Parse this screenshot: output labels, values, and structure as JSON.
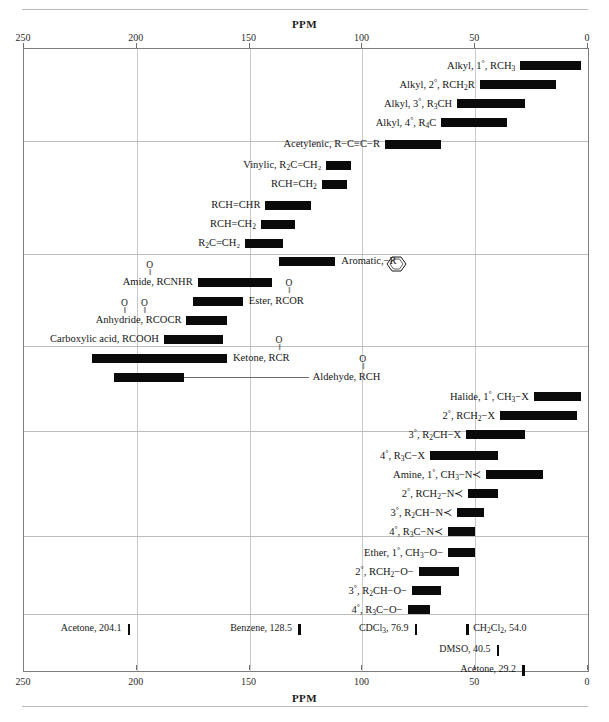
{
  "axis": {
    "title": "PPM",
    "ticks": [
      250,
      200,
      150,
      100,
      50,
      0
    ],
    "min_ppm": 0,
    "max_ppm": 250
  },
  "chart_data": {
    "type": "bar",
    "orientation": "horizontal-range",
    "title": "PPM",
    "xlabel": "PPM",
    "ylabel": "",
    "xlim": [
      250,
      0
    ],
    "x_reversed": true,
    "grid": true,
    "legend": "none",
    "categories": [
      "Alkyl, 1°, RCH3",
      "Alkyl, 2°, RCH2R",
      "Alkyl, 3°, R3CH",
      "Alkyl, 4°, R4C",
      "Acetylenic, R-C≡C-R",
      "Vinylic, R2C=CH2",
      "RCH=CH2",
      "RCH=CHR",
      "RCH=CH2",
      "R2C=CH2",
      "Aromatic",
      "Amide, RCONHR",
      "Ester, RCOOR",
      "Anhydride, RCOOCR",
      "Carboxylic acid, RCOOH",
      "Ketone, RCOR",
      "Aldehyde, RCHO",
      "Halide, 1°, CH3-X",
      "Halide, 2°, RCH2-X",
      "Halide, 3°, R2CH-X",
      "Halide, 4°, R3C-X",
      "Amine, 1°, CH3-N",
      "Amine, 2°, RCH2-N",
      "Amine, 3°, R2CH-N",
      "Amine, 4°, R3C-N",
      "Ether, 1°, CH3-O",
      "Ether, 2°, RCH2-O",
      "Ether, 3°, R2CH-O",
      "Ether, 4°, R3C-O"
    ],
    "ranges": [
      [
        30,
        3
      ],
      [
        48,
        14
      ],
      [
        58,
        28
      ],
      [
        65,
        36
      ],
      [
        90,
        65
      ],
      [
        116,
        105
      ],
      [
        118,
        107
      ],
      [
        143,
        123
      ],
      [
        145,
        130
      ],
      [
        152,
        135
      ],
      [
        137,
        112
      ],
      [
        173,
        140
      ],
      [
        175,
        153
      ],
      [
        178,
        160
      ],
      [
        188,
        162
      ],
      [
        220,
        160
      ],
      [
        210,
        179
      ],
      [
        24,
        3
      ],
      [
        39,
        5
      ],
      [
        54,
        28
      ],
      [
        70,
        40
      ],
      [
        45,
        20
      ],
      [
        53,
        40
      ],
      [
        58,
        46
      ],
      [
        62,
        50
      ],
      [
        62,
        50
      ],
      [
        75,
        57
      ],
      [
        78,
        65
      ],
      [
        80,
        70
      ]
    ],
    "reference_solvents": [
      {
        "label": "Acetone, 204.1",
        "ppm": 204.1
      },
      {
        "label": "Benzene, 128.5",
        "ppm": 128.5
      },
      {
        "label": "CDCl3, 76.9",
        "ppm": 76.9
      },
      {
        "label": "CH2Cl2, 54.0",
        "ppm": 54.0
      },
      {
        "label": "DMSO, 40.5",
        "ppm": 40.5
      },
      {
        "label": "Acetone, 29.2",
        "ppm": 29.2
      }
    ]
  },
  "rows": [
    {
      "label_pre": "Alkyl, 1",
      "label_deg": "°",
      "label_post": ", RCH",
      "sub": "3",
      "label_tail": "",
      "side": "left",
      "start": 30,
      "end": 3,
      "y": 60
    },
    {
      "label_pre": "Alkyl, 2",
      "label_deg": "°",
      "label_post": ", RCH",
      "sub": "2",
      "label_tail": "R",
      "side": "left",
      "start": 48,
      "end": 14,
      "y": 79
    },
    {
      "label_pre": "Alkyl, 3",
      "label_deg": "°",
      "label_post": ", R",
      "sub": "3",
      "label_tail": "CH",
      "side": "left",
      "start": 58,
      "end": 28,
      "y": 98
    },
    {
      "label_pre": "Alkyl, 4",
      "label_deg": "°",
      "label_post": ", R",
      "sub": "4",
      "label_tail": "C",
      "side": "left",
      "start": 65,
      "end": 36,
      "y": 117
    },
    {
      "label_pre": "Acetylenic, R−C≡C−R",
      "label_deg": "",
      "label_post": "",
      "sub": "",
      "label_tail": "",
      "side": "left",
      "start": 90,
      "end": 65,
      "y": 139
    },
    {
      "label_pre": "Vinylic, R",
      "label_deg": "",
      "label_post": "",
      "sub": "2",
      "label_tail": "C=CH₂",
      "side": "left",
      "start": 116,
      "end": 105,
      "y": 160
    },
    {
      "label_pre": "RCH=CH",
      "label_deg": "",
      "label_post": "",
      "sub": "2",
      "label_tail": "",
      "side": "left",
      "start": 118,
      "end": 107,
      "y": 179
    },
    {
      "label_pre": "RCH=CHR",
      "label_deg": "",
      "label_post": "",
      "sub": "",
      "label_tail": "",
      "side": "left",
      "start": 143,
      "end": 123,
      "y": 200
    },
    {
      "label_pre": "RCH=CH",
      "label_deg": "",
      "label_post": "",
      "sub": "2",
      "label_tail": "",
      "side": "left",
      "start": 145,
      "end": 130,
      "y": 219
    },
    {
      "label_pre": "R",
      "label_deg": "",
      "label_post": "",
      "sub": "2",
      "label_tail": "C=CH₂",
      "side": "left",
      "start": 152,
      "end": 135,
      "y": 238
    },
    {
      "label_pre": "Amide, RCNHR",
      "label_deg": "",
      "label_post": "",
      "sub": "",
      "label_tail": "",
      "side": "left",
      "start": 173,
      "end": 140,
      "y": 277
    },
    {
      "label_pre": "Anhydride, RCOCR",
      "label_deg": "",
      "label_post": "",
      "sub": "",
      "label_tail": "",
      "side": "left",
      "start": 178,
      "end": 160,
      "y": 315
    },
    {
      "label_pre": "Carboxylic acid, RCOOH",
      "label_deg": "",
      "label_post": "",
      "sub": "",
      "label_tail": "",
      "side": "left",
      "start": 188,
      "end": 162,
      "y": 334
    }
  ],
  "aromatic": {
    "label": "Aromatic,",
    "tail": "−R",
    "start": 137,
    "end": 112,
    "y": 256
  },
  "ester": {
    "label": "Ester, RCOR",
    "start": 175,
    "end": 153,
    "y": 296
  },
  "ketone": {
    "label": "Ketone, RCR",
    "start": 220,
    "end": 160,
    "y": 353
  },
  "aldehyde": {
    "label": "Aldehyde, RCH",
    "start": 210,
    "end": 179,
    "y": 372
  },
  "right_rows": [
    {
      "label_pre": "Halide, 1",
      "label_deg": "°",
      "label_post": ", CH",
      "sub": "3",
      "label_tail": "−X",
      "start": 24,
      "end": 3,
      "y": 391
    },
    {
      "label_pre": "2",
      "label_deg": "°",
      "label_post": ", RCH",
      "sub": "2",
      "label_tail": "−X",
      "start": 39,
      "end": 5,
      "y": 410
    },
    {
      "label_pre": "3",
      "label_deg": "°",
      "label_post": ", R",
      "sub": "2",
      "label_tail": "CH−X",
      "start": 54,
      "end": 28,
      "y": 429
    },
    {
      "label_pre": "4",
      "label_deg": "°",
      "label_post": ", R",
      "sub": "3",
      "label_tail": "C−X",
      "start": 70,
      "end": 40,
      "y": 450
    },
    {
      "label_pre": "Amine, 1",
      "label_deg": "°",
      "label_post": ", CH",
      "sub": "3",
      "label_tail": "−N≺",
      "start": 45,
      "end": 20,
      "y": 469
    },
    {
      "label_pre": "2",
      "label_deg": "°",
      "label_post": ", RCH",
      "sub": "2",
      "label_tail": "−N≺",
      "start": 53,
      "end": 40,
      "y": 488
    },
    {
      "label_pre": "3",
      "label_deg": "°",
      "label_post": ", R",
      "sub": "2",
      "label_tail": "CH−N≺",
      "start": 58,
      "end": 46,
      "y": 507
    },
    {
      "label_pre": "4",
      "label_deg": "°",
      "label_post": ", R",
      "sub": "3",
      "label_tail": "C−N≺",
      "start": 62,
      "end": 50,
      "y": 526
    },
    {
      "label_pre": "Ether, 1",
      "label_deg": "°",
      "label_post": ", CH",
      "sub": "3",
      "label_tail": "−O−",
      "start": 62,
      "end": 50,
      "y": 547
    },
    {
      "label_pre": "2",
      "label_deg": "°",
      "label_post": ", RCH",
      "sub": "2",
      "label_tail": "−O−",
      "start": 75,
      "end": 57,
      "y": 566
    },
    {
      "label_pre": "3",
      "label_deg": "°",
      "label_post": ", R",
      "sub": "2",
      "label_tail": "CH−O−",
      "start": 78,
      "end": 65,
      "y": 585
    },
    {
      "label_pre": "4",
      "label_deg": "°",
      "label_post": ", R",
      "sub": "3",
      "label_tail": "C−O−",
      "start": 80,
      "end": 70,
      "y": 604
    }
  ],
  "solvents": [
    {
      "label": "Acetone, 204.1",
      "ppm": 204.1,
      "y": 624
    },
    {
      "label": "Benzene, 128.5",
      "ppm": 128.5,
      "y": 624
    },
    {
      "label": "CDCl",
      "sub": "3",
      "tail": ", 76.9",
      "ppm": 76.9,
      "y": 624
    },
    {
      "label": "CH",
      "sub": "2",
      "mid": "Cl",
      "sub2": "2",
      "tail": ", 54.0",
      "ppm": 54.0,
      "y": 624,
      "mark_left": true
    },
    {
      "label": "DMSO, 40.5",
      "ppm": 40.5,
      "y": 645
    },
    {
      "label": "Acetone, 29.2",
      "ppm": 29.2,
      "y": 665
    }
  ],
  "carbonyl_caps": [
    {
      "text": "O",
      "for": "amide"
    },
    {
      "text": "O",
      "for": "ester"
    },
    {
      "text": "O",
      "for": "anhydride-1"
    },
    {
      "text": "O",
      "for": "anhydride-2"
    },
    {
      "text": "O",
      "for": "ketone"
    },
    {
      "text": "O",
      "for": "aldehyde"
    }
  ]
}
